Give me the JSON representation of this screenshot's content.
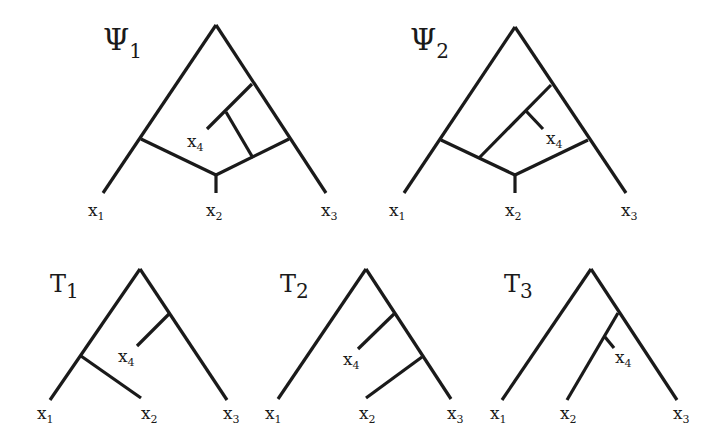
{
  "figure": {
    "networks": [
      {
        "id": "psi1",
        "symbol": "Ψ",
        "index": "1"
      },
      {
        "id": "psi2",
        "symbol": "Ψ",
        "index": "2"
      }
    ],
    "trees": [
      {
        "id": "t1",
        "symbol": "T",
        "index": "1"
      },
      {
        "id": "t2",
        "symbol": "T",
        "index": "2"
      },
      {
        "id": "t3",
        "symbol": "T",
        "index": "3"
      }
    ],
    "leaf_symbol": "x",
    "leaves": [
      "1",
      "2",
      "3",
      "4"
    ]
  }
}
